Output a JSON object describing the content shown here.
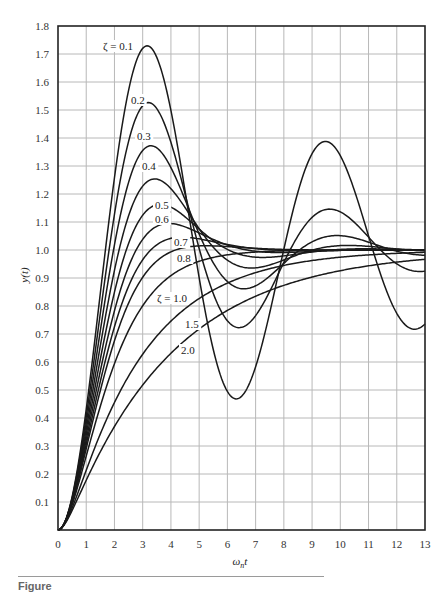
{
  "chart_data": {
    "type": "line",
    "title": "",
    "xlabel": "ωnt",
    "ylabel": "y(t)",
    "xlim": [
      0,
      13
    ],
    "ylim": [
      0,
      1.8
    ],
    "x_ticks": [
      "0",
      "1",
      "2",
      "3",
      "4",
      "5",
      "6",
      "7",
      "8",
      "9",
      "10",
      "11",
      "12",
      "13"
    ],
    "y_ticks": [
      "0.1",
      "0.2",
      "0.3",
      "0.4",
      "0.5",
      "0.6",
      "0.7",
      "0.8",
      "0.9",
      "1.0",
      "1.1",
      "1.2",
      "1.3",
      "1.4",
      "1.5",
      "1.6",
      "1.7",
      "1.8"
    ],
    "y_zero_label": "0",
    "grid": true,
    "legend": "inline labels",
    "x": [
      0,
      1,
      2,
      3,
      4,
      5,
      6,
      7,
      8,
      9,
      10,
      11,
      12,
      13
    ],
    "series": [
      {
        "name": "ζ = 0.1",
        "zeta": 0.1,
        "label": "ζ = 0.1",
        "label_pos": [
          103,
          50
        ],
        "values": [
          0,
          0.431,
          1.258,
          1.72,
          1.499,
          0.901,
          0.494,
          0.585,
          1.0,
          1.345,
          1.337,
          1.049,
          0.774,
          0.736
        ]
      },
      {
        "name": "0.2",
        "zeta": 0.2,
        "label": "0.2",
        "label_pos": [
          131,
          104
        ],
        "values": [
          0,
          0.405,
          1.128,
          1.516,
          1.385,
          1.005,
          0.747,
          0.765,
          0.956,
          1.117,
          1.136,
          1.047,
          0.952,
          0.924
        ]
      },
      {
        "name": "0.3",
        "zeta": 0.3,
        "label": "0.3",
        "label_pos": [
          137,
          140
        ],
        "values": [
          0,
          0.38,
          1.02,
          1.35,
          1.27,
          1.03,
          0.87,
          0.88,
          0.98,
          1.05,
          1.05,
          1.02,
          0.99,
          0.98
        ]
      },
      {
        "name": "0.4",
        "zeta": 0.4,
        "label": "0.4",
        "label_pos": [
          142,
          170
        ],
        "values": [
          0,
          0.36,
          0.93,
          1.22,
          1.19,
          1.05,
          0.95,
          0.95,
          0.99,
          1.02,
          1.02,
          1.01,
          1.0,
          1.0
        ]
      },
      {
        "name": "0.5",
        "zeta": 0.5,
        "label": "0.5",
        "label_pos": [
          155,
          209
        ],
        "values": [
          0,
          0.34,
          0.85,
          1.11,
          1.13,
          1.05,
          0.99,
          0.98,
          0.99,
          1.0,
          1.0,
          1.0,
          1.0,
          1.0
        ]
      },
      {
        "name": "0.6",
        "zeta": 0.6,
        "label": "0.6",
        "label_pos": [
          155,
          223
        ],
        "values": [
          0,
          0.32,
          0.78,
          1.02,
          1.07,
          1.04,
          1.01,
          1.0,
          1.0,
          1.0,
          1.0,
          1.0,
          1.0,
          1.0
        ]
      },
      {
        "name": "0.7",
        "zeta": 0.7,
        "label": "0.7",
        "label_pos": [
          174,
          246
        ],
        "values": [
          0,
          0.3,
          0.72,
          0.95,
          1.02,
          1.03,
          1.01,
          1.0,
          1.0,
          1.0,
          1.0,
          1.0,
          1.0,
          1.0
        ]
      },
      {
        "name": "0.8",
        "zeta": 0.8,
        "label": "0.8",
        "label_pos": [
          177,
          262
        ],
        "values": [
          0,
          0.28,
          0.67,
          0.89,
          0.98,
          1.01,
          1.01,
          1.0,
          1.0,
          1.0,
          1.0,
          1.0,
          1.0,
          1.0
        ]
      },
      {
        "name": "ζ = 1.0",
        "zeta": 1.0,
        "label": "ζ = 1.0",
        "label_pos": [
          157,
          302
        ],
        "values": [
          0,
          0.264,
          0.594,
          0.801,
          0.908,
          0.96,
          0.983,
          0.993,
          0.997,
          0.999,
          1.0,
          1.0,
          1.0,
          1.0
        ]
      },
      {
        "name": "1.5",
        "zeta": 1.5,
        "label": "1.5",
        "label_pos": [
          185,
          328
        ],
        "values": [
          0,
          0.21,
          0.47,
          0.66,
          0.78,
          0.86,
          0.91,
          0.94,
          0.96,
          0.98,
          0.98,
          0.99,
          0.99,
          0.99
        ]
      },
      {
        "name": "2.0",
        "zeta": 2.0,
        "label": "2.0",
        "label_pos": [
          181,
          354
        ],
        "values": [
          0,
          0.17,
          0.38,
          0.54,
          0.66,
          0.75,
          0.82,
          0.87,
          0.9,
          0.93,
          0.95,
          0.96,
          0.97,
          0.98
        ]
      }
    ]
  },
  "caption": {
    "text": "Figure"
  }
}
